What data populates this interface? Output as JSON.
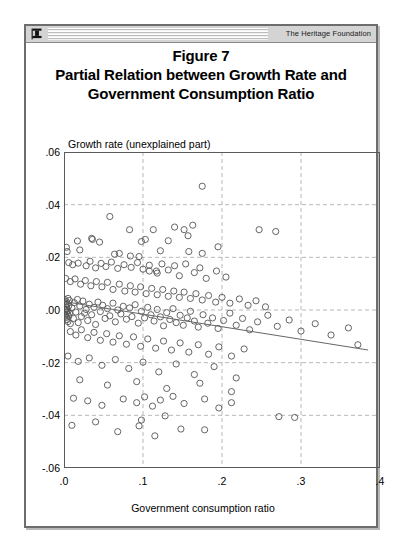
{
  "header": {
    "brand": "The Heritage Foundation",
    "logo_icon": "heritage-torch-icon"
  },
  "title": {
    "line1": "Figure 7",
    "line2": "Partial Relation between Growth Rate and",
    "line3": "Government Consumption Ratio"
  },
  "chart_data": {
    "type": "scatter",
    "title": "Partial Relation between Growth Rate and Government Consumption Ratio",
    "xlabel": "Government consumption ratio",
    "ylabel": "Growth rate (unexplained part)",
    "xlim": [
      0.0,
      0.4
    ],
    "ylim": [
      -0.06,
      0.06
    ],
    "xticks": [
      0.0,
      0.1,
      0.2,
      0.3,
      0.4
    ],
    "xticklabels": [
      ".0",
      ".1",
      ".2",
      ".3",
      ".4"
    ],
    "yticks": [
      -0.06,
      -0.04,
      -0.02,
      0.0,
      0.02,
      0.04,
      0.06
    ],
    "yticklabels": [
      "-.06",
      "-.04",
      "-.02",
      ".00",
      ".02",
      ".04",
      ".06"
    ],
    "grid": true,
    "grid_style": "dashed",
    "legend": null,
    "marker": "open-circle",
    "marker_color": "#555555",
    "trendline": {
      "name": "fitted regression line",
      "x": [
        0.0,
        0.385
      ],
      "y": [
        0.0032,
        -0.0152
      ],
      "color": "#666666"
    },
    "points": [
      [
        0.175,
        0.047
      ],
      [
        0.058,
        0.0355
      ],
      [
        0.083,
        0.0305
      ],
      [
        0.113,
        0.0305
      ],
      [
        0.14,
        0.0315
      ],
      [
        0.152,
        0.0305
      ],
      [
        0.163,
        0.0322
      ],
      [
        0.247,
        0.0305
      ],
      [
        0.268,
        0.0298
      ],
      [
        0.035,
        0.0272
      ],
      [
        0.036,
        0.0268
      ],
      [
        0.017,
        0.0262
      ],
      [
        0.045,
        0.0258
      ],
      [
        0.098,
        0.026
      ],
      [
        0.103,
        0.0268
      ],
      [
        0.132,
        0.0263
      ],
      [
        0.157,
        0.0282
      ],
      [
        0.003,
        0.0238
      ],
      [
        0.004,
        0.0222
      ],
      [
        0.02,
        0.0228
      ],
      [
        0.064,
        0.0212
      ],
      [
        0.07,
        0.0215
      ],
      [
        0.084,
        0.0205
      ],
      [
        0.095,
        0.0203
      ],
      [
        0.122,
        0.0225
      ],
      [
        0.158,
        0.0222
      ],
      [
        0.175,
        0.0215
      ],
      [
        0.195,
        0.024
      ],
      [
        0.006,
        0.018
      ],
      [
        0.011,
        0.0172
      ],
      [
        0.018,
        0.0178
      ],
      [
        0.028,
        0.0168
      ],
      [
        0.033,
        0.0185
      ],
      [
        0.04,
        0.016
      ],
      [
        0.047,
        0.0177
      ],
      [
        0.053,
        0.0165
      ],
      [
        0.06,
        0.0182
      ],
      [
        0.068,
        0.0158
      ],
      [
        0.076,
        0.0172
      ],
      [
        0.085,
        0.0162
      ],
      [
        0.093,
        0.018
      ],
      [
        0.1,
        0.0155
      ],
      [
        0.108,
        0.017
      ],
      [
        0.117,
        0.0148
      ],
      [
        0.124,
        0.0175
      ],
      [
        0.132,
        0.0152
      ],
      [
        0.14,
        0.0168
      ],
      [
        0.146,
        0.013
      ],
      [
        0.154,
        0.0175
      ],
      [
        0.165,
        0.0142
      ],
      [
        0.172,
        0.016
      ],
      [
        0.18,
        0.012
      ],
      [
        0.193,
        0.0148
      ],
      [
        0.205,
        0.0125
      ],
      [
        0.108,
        0.0148
      ],
      [
        0.118,
        0.014
      ],
      [
        0.002,
        0.012
      ],
      [
        0.008,
        0.0108
      ],
      [
        0.014,
        0.0118
      ],
      [
        0.021,
        0.0098
      ],
      [
        0.027,
        0.0112
      ],
      [
        0.034,
        0.0092
      ],
      [
        0.041,
        0.0108
      ],
      [
        0.048,
        0.0088
      ],
      [
        0.055,
        0.0105
      ],
      [
        0.062,
        0.0078
      ],
      [
        0.07,
        0.0098
      ],
      [
        0.077,
        0.0072
      ],
      [
        0.084,
        0.0092
      ],
      [
        0.09,
        0.0068
      ],
      [
        0.097,
        0.0088
      ],
      [
        0.104,
        0.0062
      ],
      [
        0.111,
        0.0082
      ],
      [
        0.118,
        0.0058
      ],
      [
        0.125,
        0.0078
      ],
      [
        0.132,
        0.0052
      ],
      [
        0.139,
        0.0072
      ],
      [
        0.146,
        0.0048
      ],
      [
        0.152,
        0.0068
      ],
      [
        0.16,
        0.0044
      ],
      [
        0.167,
        0.0062
      ],
      [
        0.175,
        0.0038
      ],
      [
        0.183,
        0.0055
      ],
      [
        0.192,
        0.003
      ],
      [
        0.2,
        0.0048
      ],
      [
        0.21,
        0.0026
      ],
      [
        0.222,
        0.0042
      ],
      [
        0.233,
        0.0018
      ],
      [
        0.243,
        0.0035
      ],
      [
        0.255,
        0.0012
      ],
      [
        0.001,
        0.004
      ],
      [
        0.002,
        0.002
      ],
      [
        0.002,
        0.0
      ],
      [
        0.002,
        -0.002
      ],
      [
        0.003,
        0.0032
      ],
      [
        0.003,
        0.0012
      ],
      [
        0.003,
        -0.0008
      ],
      [
        0.003,
        -0.0028
      ],
      [
        0.004,
        0.0024
      ],
      [
        0.004,
        0.0004
      ],
      [
        0.004,
        -0.0016
      ],
      [
        0.004,
        -0.0036
      ],
      [
        0.005,
        0.0044
      ],
      [
        0.005,
        -0.0004
      ],
      [
        0.005,
        -0.0044
      ],
      [
        0.006,
        0.0016
      ],
      [
        0.006,
        -0.0024
      ],
      [
        0.007,
        0.0036
      ],
      [
        0.007,
        -0.0012
      ],
      [
        0.008,
        -0.0052
      ],
      [
        0.01,
        0.0008
      ],
      [
        0.012,
        -0.0032
      ],
      [
        0.013,
        0.0028
      ],
      [
        0.015,
        -0.0008
      ],
      [
        0.017,
        0.004
      ],
      [
        0.018,
        -0.0048
      ],
      [
        0.02,
        0.0015
      ],
      [
        0.022,
        -0.0025
      ],
      [
        0.024,
        0.0034
      ],
      [
        0.026,
        -0.0012
      ],
      [
        0.028,
        0.0002
      ],
      [
        0.03,
        -0.004
      ],
      [
        0.032,
        0.0022
      ],
      [
        0.035,
        -0.0018
      ],
      [
        0.038,
        0.001
      ],
      [
        0.04,
        -0.0055
      ],
      [
        0.043,
        0.003
      ],
      [
        0.046,
        -0.0006
      ],
      [
        0.049,
        0.0018
      ],
      [
        0.052,
        -0.0032
      ],
      [
        0.055,
        0.0005
      ],
      [
        0.058,
        -0.0022
      ],
      [
        0.062,
        0.0026
      ],
      [
        0.065,
        -0.0045
      ],
      [
        0.068,
        0.0
      ],
      [
        0.072,
        -0.0015
      ],
      [
        0.075,
        0.0014
      ],
      [
        0.079,
        -0.0035
      ],
      [
        0.083,
        0.0008
      ],
      [
        0.086,
        -0.0025
      ],
      [
        0.09,
        0.002
      ],
      [
        0.094,
        -0.005
      ],
      [
        0.098,
        -0.0005
      ],
      [
        0.102,
        -0.003
      ],
      [
        0.106,
        0.001
      ],
      [
        0.11,
        -0.0018
      ],
      [
        0.114,
        -0.0042
      ],
      [
        0.118,
        0.0002
      ],
      [
        0.122,
        -0.0026
      ],
      [
        0.126,
        -0.006
      ],
      [
        0.13,
        -0.001
      ],
      [
        0.134,
        -0.0036
      ],
      [
        0.138,
        0.0005
      ],
      [
        0.142,
        -0.0048
      ],
      [
        0.147,
        -0.002
      ],
      [
        0.151,
        -0.0058
      ],
      [
        0.156,
        -0.003
      ],
      [
        0.16,
        -0.0005
      ],
      [
        0.165,
        -0.0042
      ],
      [
        0.17,
        -0.0065
      ],
      [
        0.176,
        -0.0018
      ],
      [
        0.182,
        -0.005
      ],
      [
        0.188,
        -0.003
      ],
      [
        0.195,
        -0.007
      ],
      [
        0.202,
        -0.004
      ],
      [
        0.21,
        -0.0012
      ],
      [
        0.218,
        -0.0058
      ],
      [
        0.226,
        -0.0032
      ],
      [
        0.235,
        -0.0075
      ],
      [
        0.245,
        -0.0045
      ],
      [
        0.258,
        -0.002
      ],
      [
        0.27,
        -0.0062
      ],
      [
        0.285,
        -0.0038
      ],
      [
        0.3,
        -0.008
      ],
      [
        0.318,
        -0.0052
      ],
      [
        0.338,
        -0.0095
      ],
      [
        0.36,
        -0.0068
      ],
      [
        0.372,
        -0.0132
      ],
      [
        0.008,
        -0.0082
      ],
      [
        0.015,
        -0.0095
      ],
      [
        0.022,
        -0.0075
      ],
      [
        0.03,
        -0.0105
      ],
      [
        0.038,
        -0.0085
      ],
      [
        0.046,
        -0.0115
      ],
      [
        0.054,
        -0.009
      ],
      [
        0.062,
        -0.0122
      ],
      [
        0.07,
        -0.0098
      ],
      [
        0.079,
        -0.013
      ],
      [
        0.088,
        -0.0102
      ],
      [
        0.097,
        -0.0138
      ],
      [
        0.106,
        -0.011
      ],
      [
        0.116,
        -0.0145
      ],
      [
        0.126,
        -0.0118
      ],
      [
        0.136,
        -0.0152
      ],
      [
        0.147,
        -0.0125
      ],
      [
        0.158,
        -0.016
      ],
      [
        0.17,
        -0.0132
      ],
      [
        0.183,
        -0.0168
      ],
      [
        0.196,
        -0.014
      ],
      [
        0.212,
        -0.0175
      ],
      [
        0.228,
        -0.0148
      ],
      [
        0.005,
        -0.0175
      ],
      [
        0.018,
        -0.0195
      ],
      [
        0.032,
        -0.0182
      ],
      [
        0.048,
        -0.021
      ],
      [
        0.065,
        -0.0188
      ],
      [
        0.082,
        -0.0222
      ],
      [
        0.1,
        -0.0198
      ],
      [
        0.12,
        -0.0235
      ],
      [
        0.142,
        -0.0205
      ],
      [
        0.165,
        -0.0245
      ],
      [
        0.19,
        -0.0215
      ],
      [
        0.218,
        -0.0258
      ],
      [
        0.02,
        -0.0265
      ],
      [
        0.055,
        -0.0285
      ],
      [
        0.092,
        -0.0272
      ],
      [
        0.13,
        -0.0298
      ],
      [
        0.172,
        -0.0278
      ],
      [
        0.212,
        -0.031
      ],
      [
        0.012,
        -0.0335
      ],
      [
        0.03,
        -0.0345
      ],
      [
        0.048,
        -0.0362
      ],
      [
        0.075,
        -0.0338
      ],
      [
        0.092,
        -0.0352
      ],
      [
        0.102,
        -0.033
      ],
      [
        0.112,
        -0.0365
      ],
      [
        0.122,
        -0.0342
      ],
      [
        0.138,
        -0.0328
      ],
      [
        0.152,
        -0.0355
      ],
      [
        0.178,
        -0.0338
      ],
      [
        0.196,
        -0.0372
      ],
      [
        0.212,
        -0.0352
      ],
      [
        0.098,
        -0.0418
      ],
      [
        0.128,
        -0.0402
      ],
      [
        0.178,
        -0.0455
      ],
      [
        0.272,
        -0.0405
      ],
      [
        0.292,
        -0.0408
      ],
      [
        0.01,
        -0.0438
      ],
      [
        0.04,
        -0.0425
      ],
      [
        0.068,
        -0.0462
      ],
      [
        0.095,
        -0.044
      ],
      [
        0.115,
        -0.0478
      ],
      [
        0.148,
        -0.0452
      ]
    ]
  }
}
